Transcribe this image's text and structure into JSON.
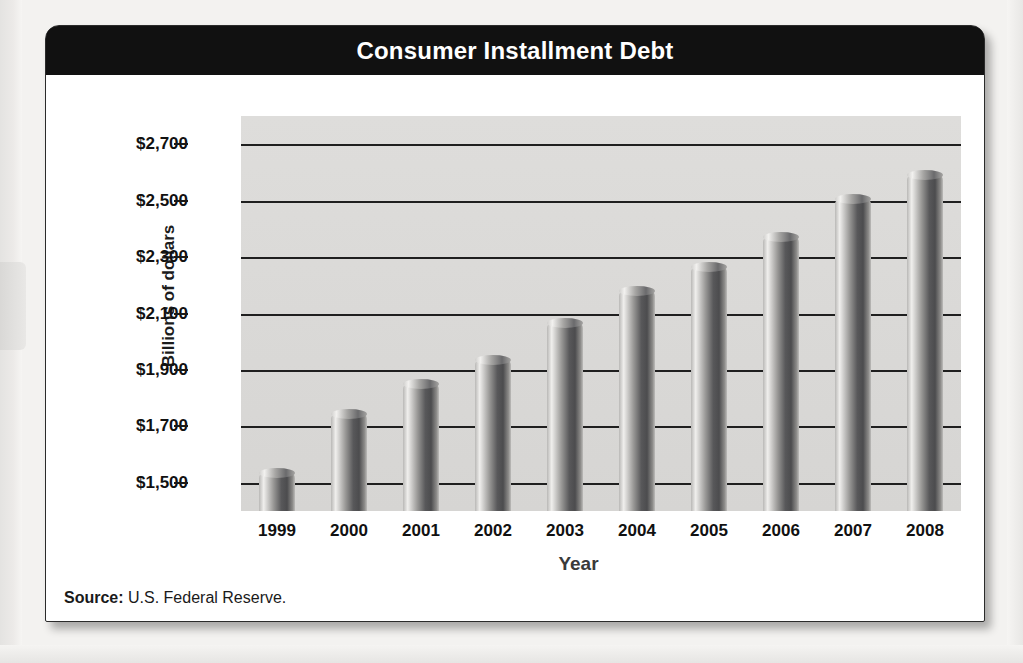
{
  "chart_data": {
    "type": "bar",
    "title": "Consumer Installment Debt",
    "xlabel": "Year",
    "ylabel": "Billions of dollars",
    "categories": [
      "1999",
      "2000",
      "2001",
      "2002",
      "2003",
      "2004",
      "2005",
      "2006",
      "2007",
      "2008"
    ],
    "values": [
      1535,
      1745,
      1850,
      1935,
      2065,
      2180,
      2265,
      2370,
      2505,
      2590
    ],
    "ylim": [
      1400,
      2800
    ],
    "ytick_values": [
      1500,
      1700,
      1900,
      2100,
      2300,
      2500,
      2700
    ],
    "ytick_labels": [
      "$1,500",
      "$1,700",
      "$1,900",
      "$2,100",
      "$2,300",
      "$2,500",
      "$2,700"
    ],
    "grid": true,
    "legend": "none",
    "bar_style": "3d-cylinder-grayscale"
  },
  "source": {
    "label": "Source:",
    "text": " U.S. Federal Reserve."
  },
  "colors": {
    "title_bar": "#111111",
    "title_text": "#ffffff",
    "plot_background": "#dedddb",
    "gridline": "#1f1f1f",
    "card_background": "#ffffff"
  }
}
